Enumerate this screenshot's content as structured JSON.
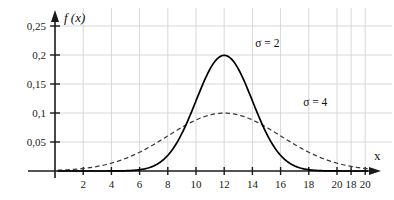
{
  "chart_data": {
    "type": "line",
    "title": "",
    "subtitle": "",
    "xlabel": "x",
    "ylabel": "f (x)",
    "xlim": [
      0,
      22
    ],
    "ylim": [
      0,
      0.27
    ],
    "grid": true,
    "legend_position": "inline-annotation",
    "x_tick_labels": [
      "2",
      "4",
      "6",
      "8",
      "10",
      "12",
      "14",
      "16",
      "18",
      "20",
      "18",
      "20"
    ],
    "x_tick_values": [
      2,
      4,
      6,
      8,
      10,
      12,
      14,
      16,
      18,
      20,
      21,
      22
    ],
    "y_tick_labels": [
      "0,05",
      "0,1",
      "0,15",
      "0,2",
      "0,25"
    ],
    "y_tick_values": [
      0.05,
      0.1,
      0.15,
      0.2,
      0.25
    ],
    "series": [
      {
        "name": "sigma-2",
        "annotation": "σ = 2",
        "style": "solid",
        "color": "#000000",
        "mu": 12,
        "sigma": 2,
        "peak_value": 0.2,
        "peak_x": 12
      },
      {
        "name": "sigma-4",
        "annotation": "σ = 4",
        "style": "dashed",
        "color": "#3a3a3a",
        "mu": 12,
        "sigma": 4,
        "peak_value": 0.1,
        "peak_x": 12
      }
    ],
    "annotations": [
      {
        "text": "σ = 2",
        "x": 14.2,
        "y": 0.213
      },
      {
        "text": "σ = 4",
        "x": 17.6,
        "y": 0.112
      }
    ]
  },
  "axes": {
    "y_axis_label": "f (x)",
    "x_axis_label": "x"
  },
  "colors": {
    "grid": "#d8d8d8",
    "axis": "#1a1a1a",
    "solid_curve": "#000000",
    "dashed_curve": "#3a3a3a",
    "background": "#ffffff"
  }
}
